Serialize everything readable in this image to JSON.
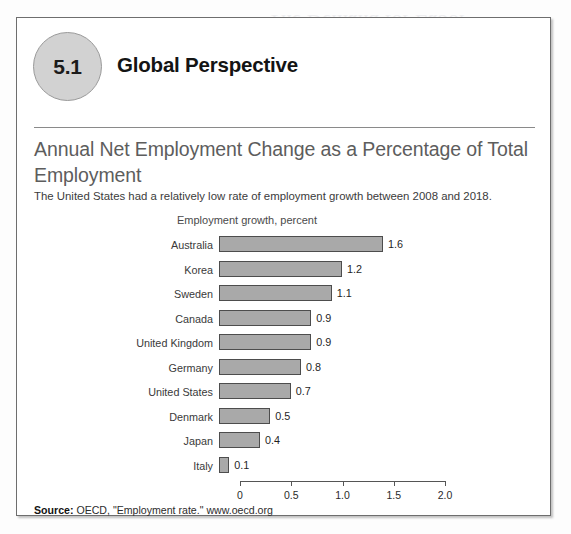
{
  "background_ghost_text": {
    "line1": "The Demand for Labor",
    "line2": "Global Perspective"
  },
  "figure": {
    "chapter_badge_number": "5.1",
    "section_heading": "Global Perspective",
    "title": "Annual Net Employment Change as a Percentage of Total Employment",
    "subtitle": "The United States had a relatively low rate of employment growth between 2008 and 2018.",
    "source_label": "Source:",
    "source_text": "OECD, \"Employment rate.\" www.oecd.org"
  },
  "colors": {
    "bar_fill": "#a9a9a9",
    "bar_stroke": "#4d4d4d",
    "badge_fill": "#d2d2d2",
    "title_text": "#5d5d5d",
    "box_border": "#6e6e6e"
  },
  "chart_data": {
    "type": "bar",
    "orientation": "horizontal",
    "title": "Annual Net Employment Change as a Percentage of Total Employment",
    "subtitle": "The United States had a relatively low rate of employment growth between 2008 and 2018.",
    "axis_label": "Employment growth, percent",
    "xlabel": "Employment growth, percent",
    "ylabel": "",
    "xlim": [
      0,
      2.0
    ],
    "xticks": [
      0,
      0.5,
      1.0,
      1.5,
      2.0
    ],
    "xtick_labels": [
      "0",
      "0.5",
      "1.0",
      "1.5",
      "2.0"
    ],
    "grid": false,
    "legend": null,
    "data_labels": true,
    "categories": [
      "Australia",
      "Korea",
      "Sweden",
      "Canada",
      "United Kingdom",
      "Germany",
      "United States",
      "Denmark",
      "Japan",
      "Italy"
    ],
    "values": [
      1.6,
      1.2,
      1.1,
      0.9,
      0.9,
      0.8,
      0.7,
      0.5,
      0.4,
      0.1
    ],
    "value_labels": [
      "1.6",
      "1.2",
      "1.1",
      "0.9",
      "0.9",
      "0.8",
      "0.7",
      "0.5",
      "0.4",
      "0.1"
    ],
    "rows": [
      {
        "label": "Australia",
        "value": 1.6,
        "value_label": "1.6"
      },
      {
        "label": "Korea",
        "value": 1.2,
        "value_label": "1.2"
      },
      {
        "label": "Sweden",
        "value": 1.1,
        "value_label": "1.1"
      },
      {
        "label": "Canada",
        "value": 0.9,
        "value_label": "0.9"
      },
      {
        "label": "United Kingdom",
        "value": 0.9,
        "value_label": "0.9"
      },
      {
        "label": "Germany",
        "value": 0.8,
        "value_label": "0.8"
      },
      {
        "label": "United States",
        "value": 0.7,
        "value_label": "0.7"
      },
      {
        "label": "Denmark",
        "value": 0.5,
        "value_label": "0.5"
      },
      {
        "label": "Japan",
        "value": 0.4,
        "value_label": "0.4"
      },
      {
        "label": "Italy",
        "value": 0.1,
        "value_label": "0.1"
      }
    ],
    "source": "OECD, \"Employment rate.\" www.oecd.org"
  }
}
